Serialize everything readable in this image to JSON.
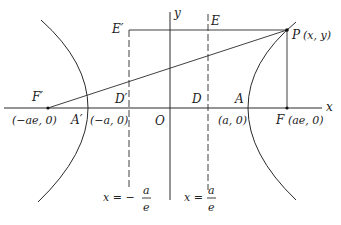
{
  "figure": {
    "axes": {
      "x_label": "x",
      "y_label": "y",
      "origin_label": "O"
    },
    "points": {
      "P": {
        "name": "P",
        "coord": "(x, y)"
      },
      "F": {
        "name": "F",
        "coord": "(ae, 0)"
      },
      "F_prime": {
        "name": "F′",
        "coord": "(−ae, 0)"
      },
      "A": {
        "name": "A",
        "coord": "(a, 0)"
      },
      "A_prime": {
        "name": "A′",
        "coord": "(−a, 0)"
      },
      "D": {
        "name": "D"
      },
      "D_prime": {
        "name": "D′"
      },
      "E": {
        "name": "E"
      },
      "E_prime": {
        "name": "E′"
      }
    },
    "directrices": {
      "left": {
        "lhs": "x = −",
        "num": "a",
        "den": "e"
      },
      "right": {
        "lhs": "x = ",
        "num": "a",
        "den": "e"
      }
    }
  }
}
